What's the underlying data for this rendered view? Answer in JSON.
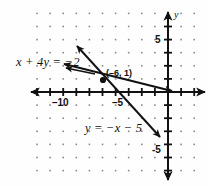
{
  "figure": {
    "kind": "coordinate-plane-graph",
    "background_color": "#fefefe",
    "ink_color": "#111111",
    "dot_grid_color": "#8a8a8a"
  },
  "axes": {
    "x_axis_label": "",
    "y_axis_label": "y",
    "x_ticks": [
      {
        "value": -10,
        "label": "-10"
      },
      {
        "value": -5,
        "label": "-5"
      }
    ],
    "y_ticks": [
      {
        "value": 5,
        "label": "5"
      },
      {
        "value": -5,
        "label": "-5"
      }
    ],
    "x_range": [
      -13,
      2
    ],
    "y_range": [
      -7,
      7
    ],
    "tick_spacing_units": 1,
    "arrows": "both-ends-both-axes"
  },
  "chart_data": {
    "type": "line",
    "title": "",
    "xlabel": "",
    "ylabel": "y",
    "xlim": [
      -13,
      2
    ],
    "ylim": [
      -7,
      7
    ],
    "grid": "dots",
    "series": [
      {
        "name": "x + 4y = -2",
        "label": "x + 4y = -2",
        "equation": "x + 4y = -2",
        "slope": -0.25,
        "intercept": -0.5,
        "points": [
          [
            -10.5,
            2.125
          ],
          [
            0.5,
            -0.625
          ]
        ],
        "arrowheads": [
          "start",
          "end"
        ]
      },
      {
        "name": "y = -x - 5",
        "label": "y = -x - 5",
        "equation": "y = -x - 5",
        "slope": -1,
        "intercept": -5,
        "points": [
          [
            -8.5,
            3.5
          ],
          [
            -0.6,
            -4.4
          ]
        ],
        "arrowheads": [
          "start",
          "end"
        ]
      }
    ],
    "annotations": [
      {
        "name": "intersection-point",
        "label": "(-6, 1)",
        "x": -6,
        "y": 1,
        "marker": "filled-dot"
      }
    ]
  },
  "labels": {
    "equation_1": "x + 4y = −2",
    "equation_2": "y = −x − 5",
    "point": "(–6, 1)",
    "x_neg10": "–10",
    "x_neg5": "–5",
    "y_5": "5",
    "y_neg5": "-5",
    "y_axis_name": "y"
  }
}
